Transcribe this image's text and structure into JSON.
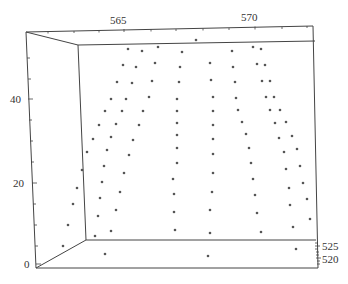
{
  "chart_data": {
    "type": "scatter",
    "projection": "3d",
    "title": "",
    "xlabel": "",
    "ylabel": "",
    "zlabel": "",
    "x_axis": {
      "ticks": [
        "565",
        "570"
      ]
    },
    "y_axis": {
      "ticks": [
        "520",
        "525"
      ]
    },
    "z_axis": {
      "ticks": [
        "0",
        "20",
        "40"
      ],
      "range": [
        0,
        55
      ]
    },
    "grid": false,
    "legend": null,
    "point_color": "#555555",
    "points_screen": [
      [
        196,
        40
      ],
      [
        128,
        49
      ],
      [
        142,
        51
      ],
      [
        158,
        47
      ],
      [
        182,
        52
      ],
      [
        232,
        51
      ],
      [
        253,
        47
      ],
      [
        261,
        49
      ],
      [
        123,
        65
      ],
      [
        136,
        67
      ],
      [
        155,
        63
      ],
      [
        180,
        67
      ],
      [
        210,
        63
      ],
      [
        233,
        67
      ],
      [
        257,
        64
      ],
      [
        265,
        65
      ],
      [
        117,
        82
      ],
      [
        132,
        83
      ],
      [
        152,
        81
      ],
      [
        179,
        82
      ],
      [
        211,
        80
      ],
      [
        235,
        82
      ],
      [
        262,
        81
      ],
      [
        270,
        81
      ],
      [
        111,
        99
      ],
      [
        126,
        99
      ],
      [
        149,
        97
      ],
      [
        177,
        99
      ],
      [
        213,
        97
      ],
      [
        236,
        98
      ],
      [
        266,
        97
      ],
      [
        274,
        97
      ],
      [
        105,
        111
      ],
      [
        122,
        111
      ],
      [
        143,
        111
      ],
      [
        177,
        111
      ],
      [
        213,
        111
      ],
      [
        238,
        110
      ],
      [
        270,
        110
      ],
      [
        280,
        110
      ],
      [
        99,
        125
      ],
      [
        116,
        124
      ],
      [
        139,
        125
      ],
      [
        177,
        123
      ],
      [
        213,
        125
      ],
      [
        242,
        122
      ],
      [
        275,
        123
      ],
      [
        286,
        122
      ],
      [
        93,
        139
      ],
      [
        111,
        137
      ],
      [
        133,
        140
      ],
      [
        177,
        135
      ],
      [
        213,
        139
      ],
      [
        246,
        134
      ],
      [
        279,
        138
      ],
      [
        292,
        136
      ],
      [
        87,
        152
      ],
      [
        107,
        150
      ],
      [
        129,
        155
      ],
      [
        177,
        148
      ],
      [
        213,
        154
      ],
      [
        249,
        148
      ],
      [
        284,
        152
      ],
      [
        297,
        149
      ],
      [
        104,
        166
      ],
      [
        124,
        173
      ],
      [
        177,
        163
      ],
      [
        213,
        173
      ],
      [
        251,
        163
      ],
      [
        286,
        169
      ],
      [
        300,
        166
      ],
      [
        82,
        170
      ],
      [
        77,
        188
      ],
      [
        102,
        182
      ],
      [
        120,
        192
      ],
      [
        173,
        179
      ],
      [
        253,
        179
      ],
      [
        289,
        188
      ],
      [
        303,
        183
      ],
      [
        73,
        204
      ],
      [
        100,
        198
      ],
      [
        116,
        210
      ],
      [
        174,
        194
      ],
      [
        212,
        192
      ],
      [
        255,
        195
      ],
      [
        290,
        205
      ],
      [
        307,
        199
      ],
      [
        68,
        225
      ],
      [
        98,
        216
      ],
      [
        111,
        231
      ],
      [
        174,
        212
      ],
      [
        210,
        210
      ],
      [
        257,
        213
      ],
      [
        293,
        227
      ],
      [
        310,
        219
      ],
      [
        95,
        236
      ],
      [
        175,
        230
      ],
      [
        210,
        233
      ],
      [
        261,
        232
      ],
      [
        63,
        246
      ],
      [
        105,
        254
      ],
      [
        208,
        256
      ],
      [
        296,
        249
      ]
    ]
  },
  "labels": {
    "x_tick_565": "565",
    "x_tick_570": "570",
    "z_tick_40": "40",
    "z_tick_20": "20",
    "z_tick_0": "0",
    "y_tick_525": "525",
    "y_tick_520": "520"
  }
}
